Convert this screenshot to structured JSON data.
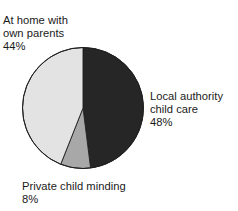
{
  "chart_data": {
    "type": "pie",
    "title": "",
    "subtitle": "",
    "xlabel": "",
    "ylabel": "",
    "grid": false,
    "legend_position": "callout-labels",
    "units": "percent",
    "start_angle_deg": 0,
    "direction": "clockwise",
    "categories": [
      "Local authority child care",
      "Private child minding",
      "At home with own parents"
    ],
    "values": [
      48,
      8,
      44
    ],
    "colors": [
      "#262626",
      "#a8a8a8",
      "#e3e3e3"
    ],
    "slices": [
      {
        "name": "Local authority child care",
        "value": 48,
        "value_label": "48%",
        "color": "#262626",
        "label_lines": [
          "Local authority",
          "child care"
        ]
      },
      {
        "name": "Private child minding",
        "value": 8,
        "value_label": "8%",
        "color": "#a8a8a8",
        "label_lines": [
          "Private child minding"
        ]
      },
      {
        "name": "At home with own parents",
        "value": 44,
        "value_label": "44%",
        "color": "#e3e3e3",
        "label_lines": [
          "At home with",
          "own parents"
        ]
      }
    ]
  },
  "labels": {
    "home": {
      "line1": "At home with",
      "line2": "own parents",
      "value": "44%"
    },
    "local": {
      "line1": "Local authority",
      "line2": "child care",
      "value": "48%"
    },
    "private": {
      "line1": "Private child minding",
      "value": "8%"
    }
  },
  "style": {
    "outline_color": "#1f1f1f",
    "background": "#ffffff"
  }
}
